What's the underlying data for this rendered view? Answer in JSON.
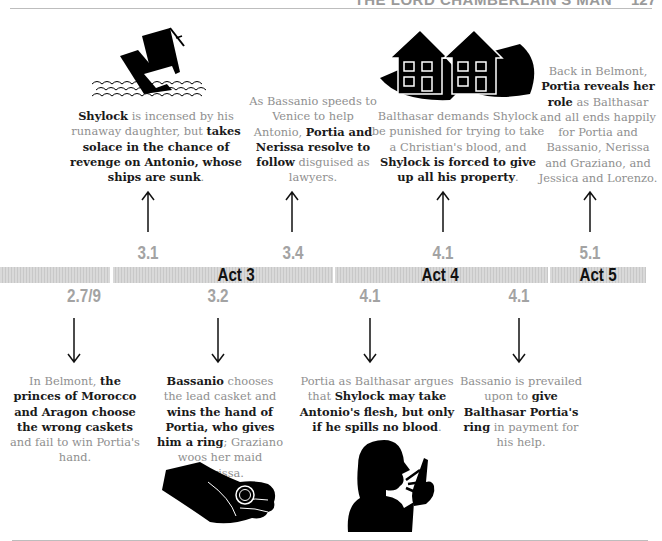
{
  "header": {
    "title": "THE LORD CHAMBERLAIN'S MAN",
    "page_number": "127"
  },
  "timeline": {
    "bars": [
      {
        "id": "act2",
        "label": ""
      },
      {
        "id": "act3",
        "label": "Act 3"
      },
      {
        "id": "act4",
        "label": "Act 4"
      },
      {
        "id": "act5",
        "label": "Act 5"
      }
    ],
    "top_scenes": [
      "3.1",
      "3.4",
      "4.1",
      "5.1"
    ],
    "bottom_scenes": [
      "2.7/9",
      "3.2",
      "4.1",
      "4.1"
    ]
  },
  "events_top": [
    {
      "scene": "3.1",
      "illustration": "sinking-ship-icon",
      "segments": [
        {
          "t": "Shylock",
          "b": true
        },
        {
          "t": " is incensed by his runaway daughter, but ",
          "b": false
        },
        {
          "t": "takes solace in the chance of revenge on Antonio, whose ships are sunk",
          "b": true
        },
        {
          "t": ".",
          "b": false
        }
      ]
    },
    {
      "scene": "3.4",
      "illustration": "",
      "segments": [
        {
          "t": "As Bassanio speeds to Venice to help Antonio, ",
          "b": false
        },
        {
          "t": "Portia and Nerissa resolve to follow",
          "b": true
        },
        {
          "t": " disguised as lawyers.",
          "b": false
        }
      ]
    },
    {
      "scene": "4.1",
      "illustration": "houses-in-hands-icon",
      "segments": [
        {
          "t": "Balthasar demands Shylock be punished for trying to take a Christian's blood, and ",
          "b": false
        },
        {
          "t": "Shylock is forced to give up all his property",
          "b": true
        },
        {
          "t": ".",
          "b": false
        }
      ]
    },
    {
      "scene": "5.1",
      "illustration": "",
      "segments": [
        {
          "t": "Back in Belmont, ",
          "b": false
        },
        {
          "t": "Portia reveals her role",
          "b": true
        },
        {
          "t": " as Balthasar and all ends happily for Portia and Bassanio, Nerissa and Graziano, and Jessica and Lorenzo.",
          "b": false
        }
      ]
    }
  ],
  "events_bottom": [
    {
      "scene": "2.7/9",
      "illustration": "",
      "segments": [
        {
          "t": "In Belmont, ",
          "b": false
        },
        {
          "t": "the princes of Morocco and Aragon choose the wrong caskets",
          "b": true
        },
        {
          "t": " and fail to win Portia's hand.",
          "b": false
        }
      ]
    },
    {
      "scene": "3.2",
      "illustration": "hand-with-ring-icon",
      "segments": [
        {
          "t": "Bassanio",
          "b": true
        },
        {
          "t": " chooses the lead casket and ",
          "b": false
        },
        {
          "t": "wins the hand of Portia, who gives him a ring",
          "b": true
        },
        {
          "t": "; Graziano woos her maid Nerissa.",
          "b": false
        }
      ]
    },
    {
      "scene": "4.1",
      "illustration": "person-speaking-icon",
      "segments": [
        {
          "t": "Portia as Balthasar argues that ",
          "b": false
        },
        {
          "t": "Shylock may take Antonio's flesh, but only if he spills no blood",
          "b": true
        },
        {
          "t": ".",
          "b": false
        }
      ]
    },
    {
      "scene": "4.1",
      "illustration": "",
      "segments": [
        {
          "t": "Bassanio is prevailed upon to ",
          "b": false
        },
        {
          "t": "give Balthasar Portia's ring",
          "b": true
        },
        {
          "t": " in payment for his help.",
          "b": false
        }
      ]
    }
  ],
  "colors": {
    "scene_number": "#a3a3a3",
    "bar": "#d4d4d4",
    "act_label": "#111111",
    "body_text": "#8f8f8f",
    "bold_text": "#1a1a1a"
  }
}
